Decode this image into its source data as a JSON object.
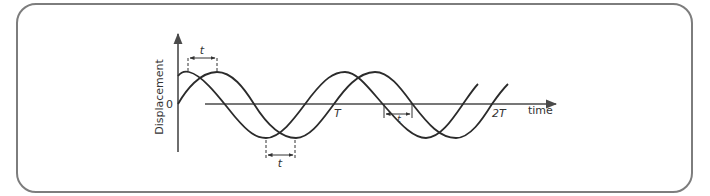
{
  "diagram": {
    "type": "wave-phase-difference",
    "axes": {
      "y_label": "Displacement",
      "x_label": "time",
      "origin_label": "0"
    },
    "ticks": {
      "period": "T",
      "double_period": "2T"
    },
    "annotations": {
      "top_shift": "t",
      "bottom_shift": "t",
      "axis_shift": "t"
    },
    "colors": {
      "curve": "#2b2b2b",
      "axis": "#4a4a4a",
      "frame": "#7d7d7d",
      "text": "#333333"
    }
  }
}
